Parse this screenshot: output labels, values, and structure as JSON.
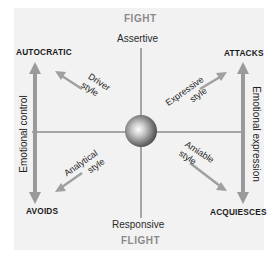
{
  "diagram": {
    "poles": {
      "top": "FIGHT",
      "bottom": "FLIGHT"
    },
    "vertical_axis": {
      "top": "Assertive",
      "bottom": "Responsive"
    },
    "corners": {
      "top_left": "AUTOCRATIC",
      "top_right": "ATTACKS",
      "bottom_left": "AVOIDS",
      "bottom_right": "ACQUIESCES"
    },
    "side_arrows": {
      "left": "Emotional control",
      "right": "Emotional expression"
    },
    "styles": {
      "top_left": {
        "line1": "Driver",
        "line2": "style"
      },
      "top_right": {
        "line1": "Expressive",
        "line2": "style"
      },
      "bottom_left": {
        "line1": "Analytical",
        "line2": "style"
      },
      "bottom_right": {
        "line1": "Amiable",
        "line2": "style"
      }
    },
    "colors": {
      "panel": "#f2f2f2",
      "arrow": "#9a9a9a",
      "axis_line": "#555555",
      "pole_text": "#8a8a8a",
      "label_text": "#1a1a1a"
    }
  }
}
